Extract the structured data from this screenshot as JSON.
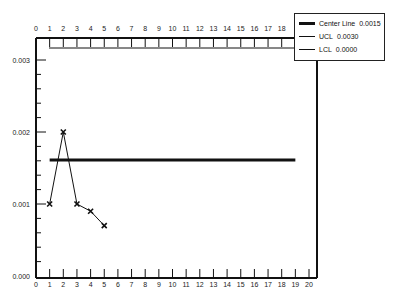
{
  "chart_data": {
    "type": "line",
    "title": "",
    "xlabel": "",
    "ylabel": "",
    "x": [
      1,
      2,
      3,
      4,
      5
    ],
    "series": [
      {
        "name": "Samples",
        "values": [
          0.001,
          0.002,
          0.001,
          0.0009,
          0.0007
        ],
        "marker": "x"
      }
    ],
    "reference_lines": [
      {
        "name": "Center Line",
        "value": 0.0015,
        "x_range": [
          1,
          19
        ]
      },
      {
        "name": "UCL",
        "value": 0.003
      },
      {
        "name": "LCL",
        "value": 0.0
      }
    ],
    "xlim": [
      0,
      20
    ],
    "ylim": [
      0,
      0.003
    ],
    "x_ticks_bottom": [
      "0",
      "1",
      "2",
      "3",
      "4",
      "5",
      "6",
      "7",
      "8",
      "9",
      "10",
      "11",
      "12",
      "13",
      "14",
      "15",
      "16",
      "17",
      "18",
      "19",
      "20"
    ],
    "x_ticks_top": [
      "0",
      "1",
      "2",
      "3",
      "4",
      "5",
      "6",
      "7",
      "8",
      "9",
      "10",
      "11",
      "12",
      "13",
      "14",
      "15",
      "16",
      "17",
      "18"
    ],
    "y_ticks": [
      "0.000",
      "0.001",
      "0.002",
      "0.003"
    ],
    "grid": false,
    "legend_position": "top-right"
  },
  "legend": {
    "items": [
      {
        "label": "Center Line",
        "value": "0.0015",
        "thickness": 3
      },
      {
        "label": "UCL",
        "value": "0.0030",
        "thickness": 1
      },
      {
        "label": "LCL",
        "value": "0.0000",
        "thickness": 1
      }
    ]
  }
}
